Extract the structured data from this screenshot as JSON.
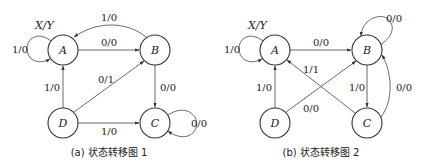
{
  "diagrams": [
    {
      "caption": "(a) 状态转移图 1",
      "legend": "X/Y",
      "states": [
        "A",
        "B",
        "C",
        "D"
      ],
      "transitions": [
        {
          "from": "A",
          "to": "A",
          "label": "1/0"
        },
        {
          "from": "A",
          "to": "B",
          "label": "0/0"
        },
        {
          "from": "B",
          "to": "A",
          "label": "1/0"
        },
        {
          "from": "B",
          "to": "C",
          "label": "0/0"
        },
        {
          "from": "C",
          "to": "C",
          "label": "0/0"
        },
        {
          "from": "D",
          "to": "A",
          "label": "1/0"
        },
        {
          "from": "D",
          "to": "B",
          "label": "0/1"
        },
        {
          "from": "D",
          "to": "C",
          "label": "1/0"
        }
      ]
    },
    {
      "caption": "(b) 状态转移图 2",
      "legend": "X/Y",
      "states": [
        "A",
        "B",
        "C",
        "D"
      ],
      "transitions": [
        {
          "from": "A",
          "to": "A",
          "label": "1/0"
        },
        {
          "from": "A",
          "to": "B",
          "label": "0/0"
        },
        {
          "from": "B",
          "to": "B",
          "label": "0/0"
        },
        {
          "from": "B",
          "to": "C",
          "label": "1/0"
        },
        {
          "from": "C",
          "to": "A",
          "label": "1/1"
        },
        {
          "from": "C",
          "to": "B",
          "label": "0/0"
        },
        {
          "from": "D",
          "to": "A",
          "label": "1/0"
        },
        {
          "from": "D",
          "to": "B",
          "label": "0/0"
        }
      ]
    }
  ]
}
